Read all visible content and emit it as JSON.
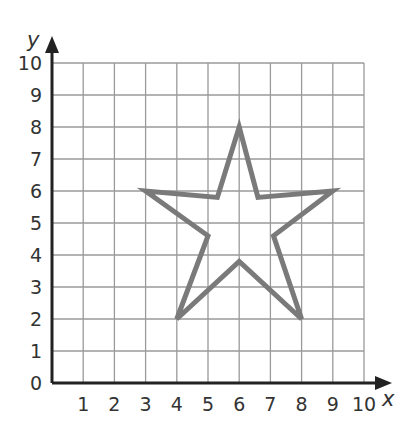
{
  "diagram": {
    "type": "coordinate-grid",
    "x_axis": {
      "label": "x",
      "min": 0,
      "max": 10,
      "ticks": [
        "1",
        "2",
        "3",
        "4",
        "5",
        "6",
        "7",
        "8",
        "9",
        "10"
      ]
    },
    "y_axis": {
      "label": "y",
      "min": 0,
      "max": 10,
      "ticks": [
        "0",
        "1",
        "2",
        "3",
        "4",
        "5",
        "6",
        "7",
        "8",
        "9",
        "10"
      ]
    },
    "grid": true,
    "colors": {
      "grid": "#9a9a9a",
      "axis": "#222222",
      "shape_stroke": "#7a7a7a"
    },
    "shape": {
      "name": "star",
      "vertices": [
        [
          6,
          8
        ],
        [
          6.6,
          5.8
        ],
        [
          9,
          6
        ],
        [
          7.1,
          4.6
        ],
        [
          8,
          2
        ],
        [
          6,
          3.8
        ],
        [
          4,
          2
        ],
        [
          5,
          4.6
        ],
        [
          3,
          6
        ],
        [
          5.3,
          5.8
        ]
      ]
    }
  }
}
